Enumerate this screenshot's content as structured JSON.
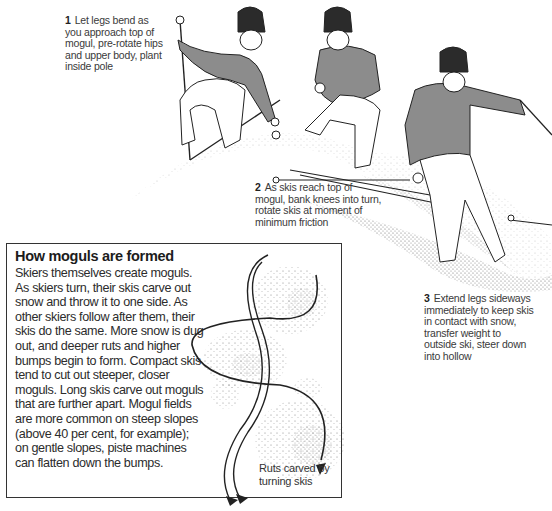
{
  "captions": {
    "step1": {
      "number": "1",
      "text": "Let legs bend as you approach top of mogul, pre-rotate hips and upper body, plant inside pole"
    },
    "step2": {
      "number": "2",
      "text": "As skis reach top of mogul, bank knees into turn, rotate skis at moment of minimum friction"
    },
    "step3": {
      "number": "3",
      "text": "Extend legs sideways immediately to keep skis in contact with snow, transfer weight to outside ski, steer down into hollow"
    }
  },
  "sidebar": {
    "title": "How moguls are formed",
    "body": "Skiers themselves create moguls. As skiers turn, their skis carve out snow and throw it to one side. As other skiers follow after them, their skis do the same. More snow is dug out, and deeper ruts and higher bumps begin to form. Compact skis tend to cut out steeper, closer moguls. Long skis carve out moguls that are further apart. Mogul fields are more common on steep slopes (above 40 per cent, for example); on gentle slopes, piste machines can flatten down the bumps.",
    "diagram_label": "Ruts carved by turning skis"
  },
  "colors": {
    "sweater": "#8c8c8c",
    "hat": "#2b2b2b",
    "line": "#222222",
    "snow_dots": "#555555"
  }
}
